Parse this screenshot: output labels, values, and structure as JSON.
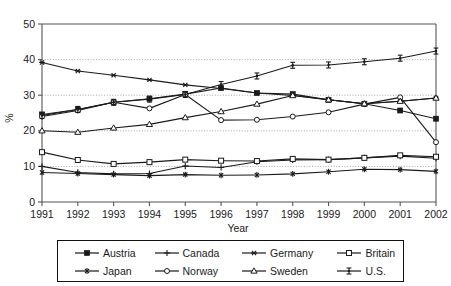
{
  "chart_data": {
    "type": "line",
    "title": "",
    "xlabel": "Year",
    "ylabel": "%",
    "categories": [
      1991,
      1992,
      1993,
      1994,
      1995,
      1996,
      1997,
      1998,
      1999,
      2000,
      2001,
      2002
    ],
    "tick_labels_x": [
      "1991",
      "1992",
      "1993",
      "1994",
      "1995",
      "1996",
      "1997",
      "1998",
      "1999",
      "2000",
      "2001",
      "2002"
    ],
    "tick_labels_y": [
      "0",
      "10",
      "20",
      "30",
      "40",
      "50"
    ],
    "yticks": [
      0,
      10,
      20,
      30,
      40,
      50
    ],
    "ylim": [
      0,
      50
    ],
    "xlim": [
      1991,
      2002
    ],
    "gridlines_y": [
      10,
      20,
      30,
      40
    ],
    "grid": "dotted-horizontal",
    "legend_position": "bottom",
    "legend_columns": 4,
    "series": [
      {
        "name": "Austria",
        "marker": "filled-square",
        "values": [
          24.6,
          26.0,
          28.0,
          29.0,
          30.3,
          32.0,
          30.6,
          30.3,
          28.7,
          27.6,
          25.7,
          23.4
        ]
      },
      {
        "name": "Canada",
        "marker": "plus",
        "values": [
          10.0,
          8.3,
          7.9,
          8.0,
          10.1,
          9.7,
          11.3,
          11.8,
          11.9,
          12.4,
          12.9,
          12.3
        ]
      },
      {
        "name": "Germany",
        "marker": "asterisk",
        "values": [
          39.2,
          36.8,
          35.6,
          34.3,
          32.9,
          31.9,
          30.6,
          29.9,
          28.7,
          27.6,
          28.3,
          29.2
        ]
      },
      {
        "name": "Britain",
        "marker": "open-square",
        "values": [
          14.0,
          11.8,
          10.7,
          11.2,
          11.9,
          11.6,
          11.5,
          12.1,
          11.9,
          12.4,
          13.1,
          12.7
        ]
      },
      {
        "name": "Japan",
        "marker": "star",
        "values": [
          8.3,
          8.0,
          7.7,
          7.4,
          7.7,
          7.5,
          7.6,
          7.9,
          8.5,
          9.2,
          9.1,
          8.6
        ]
      },
      {
        "name": "Norway",
        "marker": "open-circle",
        "values": [
          24.0,
          25.7,
          28.0,
          26.3,
          30.2,
          23.0,
          23.1,
          24.0,
          25.2,
          27.5,
          29.4,
          16.8
        ]
      },
      {
        "name": "Sweden",
        "marker": "open-triangle",
        "values": [
          20.0,
          19.6,
          20.8,
          21.8,
          23.7,
          25.4,
          27.5,
          29.9,
          28.7,
          27.6,
          28.3,
          29.2
        ]
      },
      {
        "name": "U.S.",
        "marker": "i-beam",
        "values": [
          24.3,
          26.0,
          28.0,
          28.9,
          30.2,
          33.0,
          35.4,
          38.4,
          38.5,
          39.4,
          40.4,
          42.4
        ]
      }
    ]
  },
  "legend": {
    "items": [
      {
        "label": "Austria",
        "marker": "filled-square"
      },
      {
        "label": "Canada",
        "marker": "plus"
      },
      {
        "label": "Germany",
        "marker": "asterisk"
      },
      {
        "label": "Britain",
        "marker": "open-square"
      },
      {
        "label": "Japan",
        "marker": "star"
      },
      {
        "label": "Norway",
        "marker": "open-circle"
      },
      {
        "label": "Sweden",
        "marker": "open-triangle"
      },
      {
        "label": "U.S.",
        "marker": "i-beam"
      }
    ]
  },
  "colors": {
    "line": "#1a1a1a",
    "grid": "#9a9a9a",
    "axis": "#555555",
    "background": "#ffffff"
  }
}
